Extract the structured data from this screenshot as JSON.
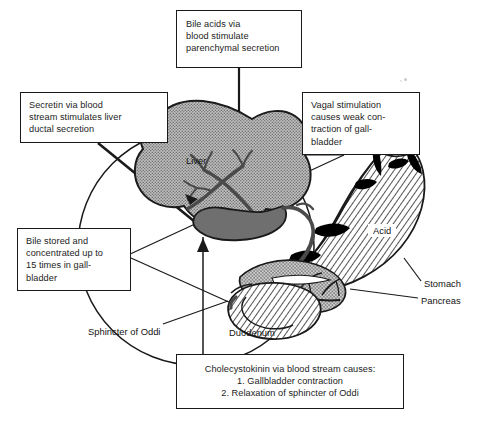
{
  "figure": {
    "canvas": {
      "width": 482,
      "height": 421
    },
    "background_color": "#ffffff",
    "line_color": "#1a1a1a"
  },
  "callouts": {
    "bile_acids": {
      "text": "Bile acids via\nblood stimulate\nparenchymal secretion"
    },
    "secretin": {
      "text": "Secretin via blood\nstream stimulates liver\nductal secretion"
    },
    "vagal": {
      "text": "Vagal stimulation\ncauses weak con-\ntraction of gall-\nbladder"
    },
    "bile_stored": {
      "text": "Bile stored and\nconcentrated up to\n15 times in gall-\nbladder"
    },
    "cholecystokinin": {
      "heading": "Cholecystokinin via blood stream causes:",
      "item_1": "1. Gallbladder contraction",
      "item_2": "2. Relaxation of sphincter of Oddi"
    }
  },
  "organ_labels": {
    "liver": "Liver",
    "acid": "Acid",
    "stomach": "Stomach",
    "pancreas": "Pancreas",
    "sphincter_of_oddi": "Sphincter of Oddi",
    "duodenum": "Duodenum"
  },
  "colors": {
    "liver_fill": "#9e9e9e",
    "gallbladder_fill": "#6f6f6f",
    "pancreas_fill": "#a5a5a5",
    "stomach_hatch": "#1a1a1a",
    "stomach_fill": "#ffffff",
    "duct_fill": "#5a5a5a",
    "outline": "#1a1a1a",
    "shadow_black": "#000000"
  }
}
